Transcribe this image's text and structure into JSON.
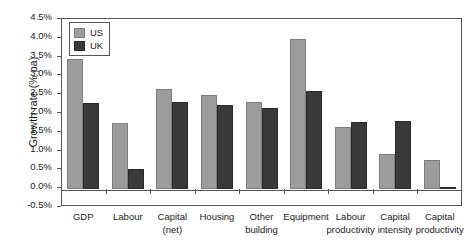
{
  "chart_data": {
    "type": "bar",
    "title": "",
    "xlabel": "",
    "ylabel": "Growth rate (% pa)",
    "ylim": [
      -0.5,
      4.5
    ],
    "ytick_step": 0.5,
    "ytick_labels": [
      "4.5%",
      "4.0%",
      "3.5%",
      "3.0%",
      "2.5%",
      "2.0%",
      "1.5%",
      "1.0%",
      "0.5%",
      "0.0%",
      "-0.5%"
    ],
    "ytick_values": [
      4.5,
      4.0,
      3.5,
      3.0,
      2.5,
      2.0,
      1.5,
      1.0,
      0.5,
      0.0,
      -0.5
    ],
    "grid": false,
    "legend_position": "top-left-inside",
    "categories": [
      "GDP",
      "Labour",
      "Capital (net)",
      "Housing",
      "Other building",
      "Equipment",
      "Labour productivity",
      "Capital intensity",
      "Capital productivity"
    ],
    "category_lines": [
      [
        "GDP",
        ""
      ],
      [
        "Labour",
        ""
      ],
      [
        "Capital",
        "(net)"
      ],
      [
        "Housing",
        ""
      ],
      [
        "Other",
        "building"
      ],
      [
        "Equipment",
        ""
      ],
      [
        "Labour",
        "productivity"
      ],
      [
        "Capital",
        "intensity"
      ],
      [
        "Capital",
        "productivity"
      ]
    ],
    "series": [
      {
        "name": "US",
        "color": "#9c9c9c",
        "values": [
          3.45,
          1.76,
          2.66,
          2.5,
          2.31,
          4.0,
          1.66,
          0.92,
          0.77
        ]
      },
      {
        "name": "UK",
        "color": "#3a3a3a",
        "values": [
          2.29,
          0.53,
          2.31,
          2.24,
          2.15,
          2.6,
          1.78,
          1.8,
          0.02
        ]
      }
    ]
  },
  "legend": {
    "items": [
      {
        "label": "US",
        "color": "#9c9c9c"
      },
      {
        "label": "UK",
        "color": "#3a3a3a"
      }
    ]
  },
  "axis": {
    "y_title": "Growth rate (% pa)"
  }
}
